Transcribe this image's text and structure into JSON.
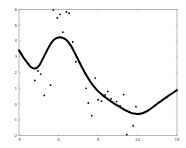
{
  "chart_data": {
    "type": "scatter",
    "title": "",
    "xlabel": "",
    "ylabel": "",
    "xlim": [
      -5,
      15
    ],
    "ylim": [
      -2,
      6
    ],
    "xticks": [
      -5,
      0,
      5,
      10,
      15
    ],
    "yticks": [
      -2,
      -1,
      0,
      1,
      2,
      3,
      4,
      5,
      6
    ],
    "grid": false,
    "legend": null,
    "series": [
      {
        "name": "observations",
        "type": "scatter",
        "color": "#000000",
        "points": [
          [
            -3.0,
            1.5
          ],
          [
            -2.6,
            2.1
          ],
          [
            -2.25,
            1.9
          ],
          [
            -1.8,
            0.55
          ],
          [
            -1.0,
            1.2
          ],
          [
            -0.65,
            5.95
          ],
          [
            -0.15,
            5.45
          ],
          [
            0.2,
            5.68
          ],
          [
            1.0,
            5.83
          ],
          [
            1.35,
            5.75
          ],
          [
            0.55,
            4.55
          ],
          [
            1.8,
            3.93
          ],
          [
            2.2,
            2.68
          ],
          [
            2.6,
            2.65
          ],
          [
            3.5,
            1.0
          ],
          [
            3.77,
            0.07
          ],
          [
            4.2,
            -0.73
          ],
          [
            4.65,
            1.65
          ],
          [
            5.0,
            0.28
          ],
          [
            5.45,
            0.18
          ],
          [
            5.9,
            0.58
          ],
          [
            6.25,
            0.81
          ],
          [
            6.65,
            0.34
          ],
          [
            7.0,
            0.05
          ],
          [
            7.35,
            0.16
          ],
          [
            7.8,
            -0.12
          ],
          [
            8.25,
            0.6
          ],
          [
            8.65,
            -1.93
          ],
          [
            9.0,
            -0.47
          ],
          [
            9.45,
            -1.37
          ],
          [
            9.8,
            -0.16
          ]
        ]
      },
      {
        "name": "fit",
        "type": "line",
        "color": "#000000",
        "points": [
          [
            -5,
            3.4
          ],
          [
            -4.5,
            3.0
          ],
          [
            -4,
            2.65
          ],
          [
            -3.5,
            2.35
          ],
          [
            -3,
            2.25
          ],
          [
            -2.5,
            2.4
          ],
          [
            -2,
            2.85
          ],
          [
            -1.5,
            3.35
          ],
          [
            -1,
            3.8
          ],
          [
            -0.5,
            4.1
          ],
          [
            0,
            4.22
          ],
          [
            0.5,
            4.2
          ],
          [
            1,
            4.05
          ],
          [
            1.5,
            3.75
          ],
          [
            2,
            3.3
          ],
          [
            2.5,
            2.8
          ],
          [
            3,
            2.3
          ],
          [
            3.5,
            1.85
          ],
          [
            4,
            1.45
          ],
          [
            4.5,
            1.1
          ],
          [
            5,
            0.82
          ],
          [
            5.5,
            0.6
          ],
          [
            6,
            0.4
          ],
          [
            6.5,
            0.22
          ],
          [
            7,
            0.05
          ],
          [
            7.5,
            -0.1
          ],
          [
            8,
            -0.25
          ],
          [
            8.5,
            -0.4
          ],
          [
            9,
            -0.52
          ],
          [
            9.5,
            -0.6
          ],
          [
            10,
            -0.63
          ],
          [
            10.5,
            -0.6
          ],
          [
            11,
            -0.5
          ],
          [
            11.5,
            -0.35
          ],
          [
            12,
            -0.17
          ],
          [
            12.5,
            0.02
          ],
          [
            13,
            0.2
          ],
          [
            13.5,
            0.38
          ],
          [
            14,
            0.55
          ],
          [
            14.5,
            0.72
          ],
          [
            15,
            0.88
          ]
        ]
      }
    ]
  }
}
